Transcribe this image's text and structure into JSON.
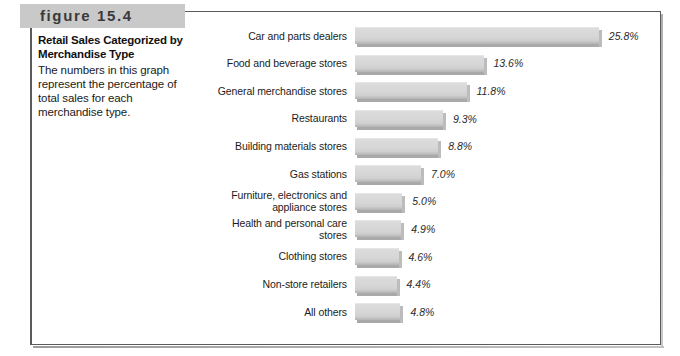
{
  "figure": {
    "band_label": "figure 15.4",
    "title": "Retail Sales Categorized by Merchandise Type",
    "description": "The numbers in this graph represent the percentage of total sales for each merchandise type."
  },
  "chart_data": {
    "type": "bar",
    "orientation": "horizontal",
    "title": "Retail Sales Categorized by Merchandise Type",
    "xlabel": "",
    "ylabel": "",
    "xlim": [
      0,
      25.8
    ],
    "grid": false,
    "legend": null,
    "value_suffix": "%",
    "categories": [
      "Car and parts dealers",
      "Food and beverage stores",
      "General merchandise stores",
      "Restaurants",
      "Building materials stores",
      "Gas stations",
      "Furniture, electronics and appliance stores",
      "Health and personal care stores",
      "Clothing stores",
      "Non-store retailers",
      "All others"
    ],
    "values": [
      25.8,
      13.6,
      11.8,
      9.3,
      8.8,
      7.0,
      5.0,
      4.9,
      4.6,
      4.4,
      4.8
    ],
    "value_labels": [
      "25.8%",
      "13.6%",
      "11.8%",
      "9.3%",
      "8.8%",
      "7.0%",
      "5.0%",
      "4.9%",
      "4.6%",
      "4.4%",
      "4.8%"
    ],
    "bars": [
      {
        "label": "Car and parts dealers",
        "label_lines": [
          "Car and parts dealers"
        ],
        "value": 25.8,
        "value_label": "25.8%"
      },
      {
        "label": "Food and beverage stores",
        "label_lines": [
          "Food and beverage stores"
        ],
        "value": 13.6,
        "value_label": "13.6%"
      },
      {
        "label": "General merchandise stores",
        "label_lines": [
          "General merchandise stores"
        ],
        "value": 11.8,
        "value_label": "11.8%"
      },
      {
        "label": "Restaurants",
        "label_lines": [
          "Restaurants"
        ],
        "value": 9.3,
        "value_label": "9.3%"
      },
      {
        "label": "Building materials stores",
        "label_lines": [
          "Building materials stores"
        ],
        "value": 8.8,
        "value_label": "8.8%"
      },
      {
        "label": "Gas stations",
        "label_lines": [
          "Gas stations"
        ],
        "value": 7.0,
        "value_label": "7.0%"
      },
      {
        "label": "Furniture, electronics and appliance stores",
        "label_lines": [
          "Furniture, electronics and",
          "appliance stores"
        ],
        "value": 5.0,
        "value_label": "5.0%"
      },
      {
        "label": "Health and personal care stores",
        "label_lines": [
          "Health and personal care",
          "stores"
        ],
        "value": 4.9,
        "value_label": "4.9%"
      },
      {
        "label": "Clothing stores",
        "label_lines": [
          "Clothing stores"
        ],
        "value": 4.6,
        "value_label": "4.6%"
      },
      {
        "label": "Non-store retailers",
        "label_lines": [
          "Non-store retailers"
        ],
        "value": 4.4,
        "value_label": "4.4%"
      },
      {
        "label": "All others",
        "label_lines": [
          "All others"
        ],
        "value": 4.8,
        "value_label": "4.8%"
      }
    ],
    "colors": {
      "bar_face": "#d6d6d6",
      "bar_shadow": "#a9a9a9",
      "bar_cap": "#bcbcbc",
      "band": "#c9c9c9",
      "frame": "#5b5b5b",
      "text": "#1c1c1c"
    },
    "px_per_unit": 9.45
  }
}
